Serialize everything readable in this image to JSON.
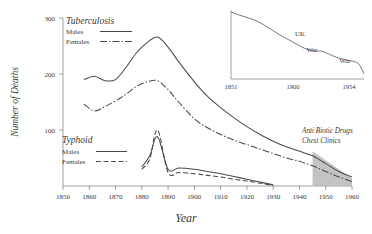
{
  "chart_data": {
    "type": "line",
    "title": "",
    "xlabel": "Year",
    "ylabel": "Number of Deaths",
    "xlim": [
      1850,
      1960
    ],
    "ylim": [
      0,
      300
    ],
    "xticks": [
      1850,
      1860,
      1870,
      1880,
      1890,
      1900,
      1910,
      1920,
      1930,
      1940,
      1950,
      1960
    ],
    "yticks": [
      100,
      200,
      300
    ],
    "grid": false,
    "legend_position": "upper-left / mid-left",
    "series": [
      {
        "name": "Tuberculosis Males",
        "group": "Tuberculosis",
        "sex": "Males",
        "style": "solid",
        "color": "#4a4a4a",
        "x": [
          1858,
          1862,
          1866,
          1870,
          1874,
          1878,
          1882,
          1886,
          1890,
          1894,
          1900,
          1905,
          1910,
          1915,
          1920,
          1925,
          1930,
          1935,
          1940,
          1945,
          1950,
          1955,
          1960
        ],
        "y": [
          190,
          196,
          188,
          190,
          212,
          238,
          256,
          266,
          248,
          222,
          186,
          160,
          140,
          122,
          106,
          92,
          80,
          70,
          62,
          54,
          40,
          26,
          16
        ]
      },
      {
        "name": "Tuberculosis Females",
        "group": "Tuberculosis",
        "sex": "Females",
        "style": "dash-dot",
        "color": "#4a4a4a",
        "x": [
          1858,
          1862,
          1866,
          1870,
          1874,
          1878,
          1882,
          1886,
          1890,
          1894,
          1900,
          1905,
          1910,
          1915,
          1920,
          1925,
          1930,
          1935,
          1940,
          1945,
          1950,
          1955,
          1960
        ],
        "y": [
          146,
          134,
          142,
          152,
          164,
          178,
          186,
          188,
          172,
          150,
          120,
          104,
          92,
          82,
          74,
          66,
          58,
          50,
          44,
          36,
          26,
          16,
          8
        ]
      },
      {
        "name": "Typhoid Males",
        "group": "Typhoid",
        "sex": "Males",
        "style": "solid",
        "color": "#4a4a4a",
        "x": [
          1880,
          1883,
          1886,
          1890,
          1894,
          1900,
          1905,
          1910,
          1915,
          1920,
          1925,
          1930
        ],
        "y": [
          34,
          54,
          88,
          30,
          32,
          30,
          26,
          22,
          17,
          12,
          7,
          2
        ]
      },
      {
        "name": "Typhoid Females",
        "group": "Typhoid",
        "sex": "Females",
        "style": "dashed",
        "color": "#4a4a4a",
        "x": [
          1880,
          1883,
          1886,
          1890,
          1894,
          1900,
          1905,
          1910,
          1915,
          1920,
          1925,
          1930
        ],
        "y": [
          30,
          48,
          100,
          24,
          24,
          22,
          19,
          16,
          12,
          9,
          5,
          1
        ]
      }
    ],
    "annotations": [
      {
        "text": "Anti Biotic Drugs",
        "x": 1948,
        "y": 86
      },
      {
        "text": "Chest Clinics",
        "x": 1948,
        "y": 74
      }
    ],
    "shaded_region": {
      "label": "Anti Biotic Drugs / Chest Clinics",
      "color": "#b8b8b8",
      "x_start": 1945,
      "x_end": 1960,
      "y_top_start": 62,
      "y_top_end": 14
    }
  },
  "legends": [
    {
      "title": "Tuberculosis",
      "entries": [
        {
          "label": "Males",
          "style": "solid"
        },
        {
          "label": "Females",
          "style": "dash-dot"
        }
      ]
    },
    {
      "title": "Typhoid",
      "entries": [
        {
          "label": "Males",
          "style": "solid"
        },
        {
          "label": "Females",
          "style": "dashed"
        }
      ]
    }
  ],
  "inset": {
    "type": "line",
    "xticks": [
      "1851",
      "1900",
      "1954"
    ],
    "annotations": [
      "UK",
      "War",
      "War"
    ],
    "series": {
      "name": "UK mortality decline",
      "x": [
        1851,
        1860,
        1870,
        1880,
        1890,
        1900,
        1910,
        1918,
        1925,
        1935,
        1945,
        1950,
        1954,
        1958
      ],
      "y": [
        100,
        94,
        88,
        78,
        66,
        56,
        46,
        42,
        41,
        33,
        28,
        26,
        22,
        8
      ]
    }
  },
  "axis_labels": {
    "x_title": "Year",
    "y_title": "Number of Deaths"
  },
  "colors": {
    "line": "#4a4a4a",
    "axis": "#8a8a8a",
    "text": "#3a3a3a",
    "shade": "#b8b8b8",
    "background": "#ffffff"
  }
}
